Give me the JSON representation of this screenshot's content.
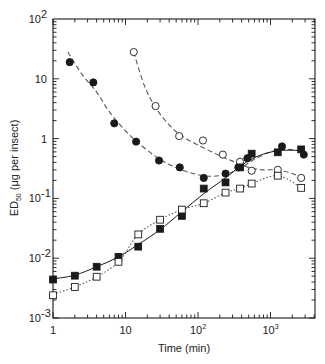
{
  "chart_data": {
    "type": "scatter",
    "title": "",
    "xlabel": "Time (min)",
    "ylabel": "ED50 (μg per insect)",
    "ylabel_main": "ED",
    "ylabel_sub": "50",
    "ylabel_rest": " (μg per insect)",
    "xscale": "log",
    "yscale": "log",
    "xlim": [
      1,
      4000
    ],
    "ylim": [
      0.001,
      100
    ],
    "grid": false,
    "legend": "none",
    "x_tick_labels": [
      {
        "value": 1,
        "base": "1",
        "exp": ""
      },
      {
        "value": 10,
        "base": "10",
        "exp": ""
      },
      {
        "value": 100,
        "base": "10",
        "exp": "2"
      },
      {
        "value": 1000,
        "base": "10",
        "exp": "3"
      }
    ],
    "y_tick_labels": [
      {
        "value": 100,
        "base": "10",
        "exp": "2"
      },
      {
        "value": 10,
        "base": "10",
        "exp": ""
      },
      {
        "value": 1,
        "base": "1",
        "exp": ""
      },
      {
        "value": 0.1,
        "base": "10",
        "exp": "-1"
      },
      {
        "value": 0.01,
        "base": "10",
        "exp": "-2"
      },
      {
        "value": 0.001,
        "base": "10",
        "exp": "-3"
      }
    ],
    "series": [
      {
        "name": "filled circles",
        "marker": "circle",
        "filled": true,
        "line": "dashed",
        "x": [
          1.7,
          3.6,
          7,
          14,
          29,
          56,
          120,
          240,
          360,
          480,
          1440,
          2880
        ],
        "y": [
          19,
          8.7,
          1.8,
          0.89,
          0.43,
          0.33,
          0.22,
          0.26,
          0.33,
          0.47,
          0.74,
          0.54
        ],
        "curve": [
          [
            1.6,
            28
          ],
          [
            2.5,
            12
          ],
          [
            4,
            6
          ],
          [
            6,
            2.8
          ],
          [
            10,
            1.35
          ],
          [
            15,
            0.85
          ],
          [
            25,
            0.52
          ],
          [
            40,
            0.37
          ],
          [
            70,
            0.28
          ],
          [
            120,
            0.24
          ],
          [
            200,
            0.24
          ],
          [
            350,
            0.3
          ],
          [
            600,
            0.45
          ],
          [
            1000,
            0.6
          ],
          [
            1500,
            0.66
          ],
          [
            2200,
            0.64
          ],
          [
            2900,
            0.6
          ]
        ]
      },
      {
        "name": "open circles",
        "marker": "circle",
        "filled": false,
        "line": "dashed",
        "x": [
          13,
          26,
          55,
          117,
          220,
          380,
          550,
          1260,
          2650
        ],
        "y": [
          28,
          3.5,
          1.1,
          0.93,
          0.54,
          0.41,
          0.29,
          0.3,
          0.22
        ],
        "curve": [
          [
            13,
            28
          ],
          [
            18,
            8
          ],
          [
            26,
            3.3
          ],
          [
            40,
            1.7
          ],
          [
            60,
            1.1
          ],
          [
            100,
            0.78
          ],
          [
            180,
            0.55
          ],
          [
            300,
            0.42
          ],
          [
            500,
            0.33
          ],
          [
            800,
            0.3
          ],
          [
            1260,
            0.3
          ],
          [
            2000,
            0.26
          ],
          [
            2900,
            0.21
          ]
        ]
      },
      {
        "name": "filled squares",
        "marker": "square",
        "filled": true,
        "line": "solid",
        "x": [
          1,
          2,
          4,
          8,
          15,
          30,
          60,
          120,
          240,
          380,
          550,
          1260,
          2650
        ],
        "y": [
          0.0044,
          0.0051,
          0.0072,
          0.0105,
          0.0156,
          0.031,
          0.051,
          0.146,
          0.185,
          0.33,
          0.56,
          0.59,
          0.66
        ],
        "curve": [
          [
            1,
            0.0045
          ],
          [
            2,
            0.0052
          ],
          [
            4,
            0.0072
          ],
          [
            8,
            0.0105
          ],
          [
            15,
            0.017
          ],
          [
            30,
            0.03
          ],
          [
            60,
            0.06
          ],
          [
            120,
            0.12
          ],
          [
            240,
            0.22
          ],
          [
            400,
            0.36
          ],
          [
            700,
            0.52
          ],
          [
            1200,
            0.62
          ],
          [
            2000,
            0.64
          ],
          [
            2900,
            0.62
          ]
        ]
      },
      {
        "name": "open squares",
        "marker": "square",
        "filled": false,
        "line": "dotted",
        "x": [
          1,
          2,
          4,
          8,
          15,
          30,
          60,
          120,
          240,
          380,
          550,
          1260,
          2650
        ],
        "y": [
          0.0024,
          0.0033,
          0.0049,
          0.0087,
          0.025,
          0.044,
          0.065,
          0.083,
          0.125,
          0.146,
          0.177,
          0.24,
          0.15
        ],
        "curve": [
          [
            1,
            0.0025
          ],
          [
            2,
            0.0033
          ],
          [
            4,
            0.0049
          ],
          [
            8,
            0.0087
          ],
          [
            15,
            0.025
          ],
          [
            30,
            0.044
          ],
          [
            60,
            0.065
          ],
          [
            120,
            0.083
          ],
          [
            240,
            0.125
          ],
          [
            380,
            0.146
          ],
          [
            550,
            0.177
          ],
          [
            1260,
            0.24
          ],
          [
            2650,
            0.15
          ]
        ]
      }
    ]
  },
  "colors": {
    "ink": "#1a1a1a",
    "background": "#ffffff",
    "curve": "#555555"
  }
}
